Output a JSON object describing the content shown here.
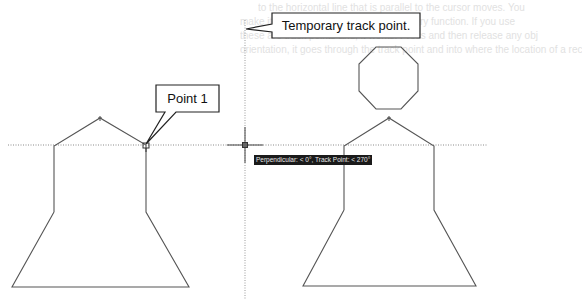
{
  "callouts": {
    "temporary_track_point": "Temporary track point.",
    "point_1": "Point 1"
  },
  "tooltip": {
    "text": "Perpendicular: < 0°, Track Point: < 270°"
  },
  "background_bleed": {
    "lines": [
      "to the horizontal line that is parallel to the cursor moves. You",
      "make it easier to remember the Temporary function. If you use",
      "these are track points and, it works. Press and then release any obj",
      "orientation, it goes through the track point and into where the location of a rec"
    ]
  },
  "drawing": {
    "line_color": "#555555",
    "track_line_color": "#8a8a8a",
    "cursor": {
      "x": 245,
      "y": 145
    },
    "left_figure": {
      "apex": [
        100,
        118
      ],
      "shoulders": [
        [
          54,
          146
        ],
        [
          146,
          145
        ]
      ],
      "waist_y": 212,
      "base": [
        [
          12,
          287
        ],
        [
          189,
          287
        ]
      ]
    },
    "right_figure": {
      "apex": [
        389,
        118
      ],
      "shoulders": [
        [
          344,
          146
        ],
        [
          434,
          146
        ]
      ],
      "waist_y": 210,
      "base": [
        [
          303,
          286
        ],
        [
          476,
          286
        ]
      ],
      "octagon": {
        "cx": 388.5,
        "cy": 78,
        "radius": 32
      }
    }
  }
}
